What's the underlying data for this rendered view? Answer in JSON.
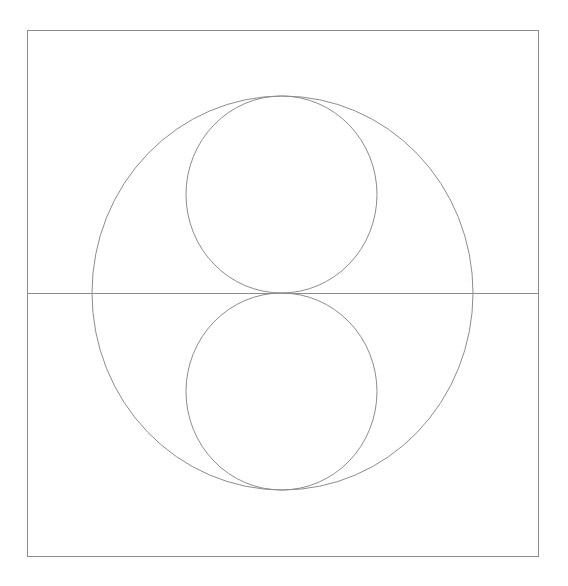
{
  "diagram": {
    "stroke_color": "#8c8c8c",
    "stroke_width": 1,
    "background": "#ffffff",
    "frame": {
      "x": 27,
      "y": 30,
      "width": 511,
      "height": 526
    },
    "horizontal_line": {
      "x1": 27,
      "y1": 293,
      "x2": 538,
      "y2": 293
    },
    "outer_circle": {
      "cx": 282.5,
      "cy": 293,
      "rx": 190.5,
      "ry": 197
    },
    "upper_circle": {
      "cx": 281.5,
      "cy": 194.5,
      "rx": 95.5,
      "ry": 98.5
    },
    "lower_circle": {
      "cx": 281.5,
      "cy": 391.5,
      "rx": 95.5,
      "ry": 98.5
    }
  }
}
